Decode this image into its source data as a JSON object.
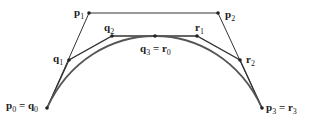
{
  "diagram": {
    "points": {
      "p0": [
        47,
        108
      ],
      "p1": [
        89,
        13
      ],
      "p2": [
        218,
        13
      ],
      "p3": [
        262,
        108
      ],
      "q1": [
        69,
        60
      ],
      "q2": [
        112,
        36
      ],
      "q3": [
        155,
        36
      ],
      "r1": [
        197,
        36
      ],
      "r2": [
        240,
        60
      ]
    },
    "labels": [
      {
        "id": "p0q0",
        "base": "p",
        "sub": "0",
        "eq_base": "q",
        "eq_sub": "0",
        "x": 6,
        "y": 100
      },
      {
        "id": "p1",
        "base": "p",
        "sub": "1",
        "x": 74,
        "y": 7
      },
      {
        "id": "p2",
        "base": "p",
        "sub": "2",
        "x": 225,
        "y": 9
      },
      {
        "id": "p3r3",
        "base": "p",
        "sub": "3",
        "eq_base": "r",
        "eq_sub": "3",
        "x": 266,
        "y": 102
      },
      {
        "id": "q1",
        "base": "q",
        "sub": "1",
        "x": 53,
        "y": 53
      },
      {
        "id": "q2",
        "base": "q",
        "sub": "2",
        "x": 104,
        "y": 22
      },
      {
        "id": "q3r0",
        "base": "q",
        "sub": "3",
        "eq_base": "r",
        "eq_sub": "0",
        "x": 140,
        "y": 43
      },
      {
        "id": "r1",
        "base": "r",
        "sub": "1",
        "x": 195,
        "y": 22
      },
      {
        "id": "r2",
        "base": "r",
        "sub": "2",
        "x": 246,
        "y": 54
      }
    ],
    "colors": {
      "line": "#333333",
      "curve": "#444444",
      "point": "#222222"
    }
  }
}
